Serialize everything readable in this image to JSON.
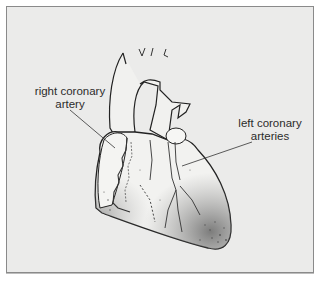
{
  "diagram": {
    "labels": [
      {
        "id": "right-coronary-artery",
        "lines": [
          "right coronary",
          "artery"
        ]
      },
      {
        "id": "left-coronary-arteries",
        "lines": [
          "left coronary",
          "arteries"
        ]
      }
    ],
    "colors": {
      "background": "#ebebea",
      "border": "#8a8a8a",
      "ink": "#2b2b2b",
      "heart_fill": "#f2f2f0"
    }
  }
}
